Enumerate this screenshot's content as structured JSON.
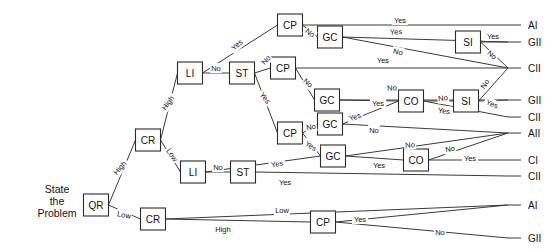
{
  "diagram": {
    "root_text_lines": [
      "State",
      "the",
      "Problem"
    ],
    "root_text_x": 57,
    "root_text_y": 205,
    "stroke_color": "#3a3a3a",
    "node_stroke": "#2a2a2a",
    "node_fill": "#ffffff",
    "text_color": "#111111"
  },
  "nodes": [
    {
      "id": "QR",
      "label": "QR",
      "x": 96,
      "y": 205,
      "w": 25,
      "h": 22
    },
    {
      "id": "CR1",
      "label": "CR",
      "x": 148,
      "y": 140,
      "w": 25,
      "h": 22
    },
    {
      "id": "CR2",
      "label": "CR",
      "x": 153,
      "y": 219,
      "w": 25,
      "h": 22
    },
    {
      "id": "LI1",
      "label": "LI",
      "x": 190,
      "y": 73,
      "w": 25,
      "h": 22
    },
    {
      "id": "LI2",
      "label": "LI",
      "x": 193,
      "y": 172,
      "w": 25,
      "h": 22
    },
    {
      "id": "ST1",
      "label": "ST",
      "x": 242,
      "y": 73,
      "w": 25,
      "h": 22
    },
    {
      "id": "ST2",
      "label": "ST",
      "x": 243,
      "y": 172,
      "w": 25,
      "h": 22
    },
    {
      "id": "CP1",
      "label": "CP",
      "x": 290,
      "y": 25,
      "w": 25,
      "h": 22
    },
    {
      "id": "CP2",
      "label": "CP",
      "x": 283,
      "y": 68,
      "w": 25,
      "h": 22
    },
    {
      "id": "CP3",
      "label": "CP",
      "x": 290,
      "y": 133,
      "w": 25,
      "h": 22
    },
    {
      "id": "CP4",
      "label": "CP",
      "x": 323,
      "y": 222,
      "w": 25,
      "h": 22
    },
    {
      "id": "GC1",
      "label": "GC",
      "x": 330,
      "y": 37,
      "w": 25,
      "h": 22
    },
    {
      "id": "GC2",
      "label": "GC",
      "x": 327,
      "y": 100,
      "w": 25,
      "h": 22
    },
    {
      "id": "GC3",
      "label": "GC",
      "x": 330,
      "y": 124,
      "w": 25,
      "h": 22
    },
    {
      "id": "GC4",
      "label": "GC",
      "x": 333,
      "y": 156,
      "w": 25,
      "h": 22
    },
    {
      "id": "CO1",
      "label": "CO",
      "x": 411,
      "y": 101,
      "w": 25,
      "h": 22
    },
    {
      "id": "CO2",
      "label": "CO",
      "x": 416,
      "y": 160,
      "w": 25,
      "h": 22
    },
    {
      "id": "SI1",
      "label": "SI",
      "x": 468,
      "y": 42,
      "w": 25,
      "h": 22
    },
    {
      "id": "SI2",
      "label": "SI",
      "x": 466,
      "y": 101,
      "w": 25,
      "h": 22
    }
  ],
  "outcomes": [
    {
      "id": "O1",
      "label": "AI",
      "x": 528,
      "y": 25,
      "tick_x": 508
    },
    {
      "id": "O2",
      "label": "GII",
      "x": 528,
      "y": 42,
      "tick_x": 508
    },
    {
      "id": "O3",
      "label": "CII",
      "x": 528,
      "y": 68,
      "tick_x": 508
    },
    {
      "id": "O4",
      "label": "GII",
      "x": 528,
      "y": 100,
      "tick_x": 508
    },
    {
      "id": "O5",
      "label": "CII",
      "x": 528,
      "y": 117,
      "tick_x": 508
    },
    {
      "id": "O6",
      "label": "AII",
      "x": 528,
      "y": 133,
      "tick_x": 508
    },
    {
      "id": "O7",
      "label": "CI",
      "x": 528,
      "y": 160,
      "tick_x": 508
    },
    {
      "id": "O8",
      "label": "CII",
      "x": 528,
      "y": 176,
      "tick_x": 508
    },
    {
      "id": "O9",
      "label": "AI",
      "x": 528,
      "y": 205,
      "tick_x": 508
    },
    {
      "id": "O10",
      "label": "GII",
      "x": 528,
      "y": 238,
      "tick_x": 508
    }
  ],
  "edges": [
    {
      "from": "QR",
      "to": "CR1",
      "label": "High",
      "lx": 120,
      "ly": 168,
      "rot": -50
    },
    {
      "from": "QR",
      "to": "CR2",
      "label": "Low",
      "lx": 124,
      "ly": 215,
      "rot": 12
    },
    {
      "from": "CR1",
      "to": "LI1",
      "label": "High",
      "lx": 168,
      "ly": 103,
      "rot": -54
    },
    {
      "from": "CR1",
      "to": "LI2",
      "label": "Low",
      "lx": 172,
      "ly": 155,
      "rot": 55
    },
    {
      "from": "LI1",
      "to": "CP1",
      "label": "Yes",
      "lx": 237,
      "ly": 45,
      "rot": -42
    },
    {
      "from": "LI1",
      "to": "ST1",
      "label": "No",
      "lx": 216,
      "ly": 68,
      "rot": 0
    },
    {
      "from": "ST1",
      "to": "CP2",
      "label": "No",
      "lx": 266,
      "ly": 60,
      "rot": -48
    },
    {
      "from": "ST1",
      "to": "CP3",
      "label": "Yes",
      "lx": 265,
      "ly": 98,
      "rot": 52
    },
    {
      "from": "CP1",
      "to": "O1",
      "label": "Yes",
      "lx": 400,
      "ly": 20,
      "rot": 0
    },
    {
      "from": "CP1",
      "to": "GC1",
      "label": "No",
      "lx": 310,
      "ly": 33,
      "rot": 38
    },
    {
      "from": "GC1",
      "to": "O2",
      "label": "Yes",
      "lx": 396,
      "ly": 32,
      "rot": -3
    },
    {
      "from": "GC1",
      "to": "O3",
      "label": "No",
      "lx": 398,
      "ly": 52,
      "rot": 11
    },
    {
      "from": "CP2",
      "to": "O3",
      "label": "Yes",
      "lx": 383,
      "ly": 60,
      "rot": 0
    },
    {
      "from": "CP2",
      "to": "GC2",
      "label": "No",
      "lx": 308,
      "ly": 83,
      "rot": 40
    },
    {
      "from": "GC2",
      "to": "O4",
      "label": "No",
      "lx": 392,
      "ly": 88,
      "rot": -3
    },
    {
      "from": "GC2",
      "to": "CO1",
      "label": "Yes",
      "lx": 378,
      "ly": 103,
      "rot": 0
    },
    {
      "from": "CO1",
      "to": "SI2",
      "label": "No",
      "lx": 443,
      "ly": 98,
      "rot": -8
    },
    {
      "from": "CO1",
      "to": "O5",
      "label": "Yes",
      "lx": 444,
      "ly": 111,
      "rot": 6
    },
    {
      "from": "SI2",
      "to": "O3",
      "label": "No",
      "lx": 485,
      "ly": 84,
      "rot": -58
    },
    {
      "from": "SI2",
      "to": "O4",
      "label": "Yes",
      "lx": 492,
      "ly": 104,
      "rot": 22
    },
    {
      "from": "SI1",
      "to": "O2",
      "label": "Yes",
      "lx": 493,
      "ly": 36,
      "rot": 0
    },
    {
      "from": "SI1",
      "to": "O3",
      "label": "No",
      "lx": 492,
      "ly": 55,
      "rot": 40
    },
    {
      "from": "CP3",
      "to": "GC3",
      "label": "No",
      "lx": 311,
      "ly": 127,
      "rot": -9
    },
    {
      "from": "CP3",
      "to": "GC4",
      "label": "Yes",
      "lx": 311,
      "ly": 146,
      "rot": 33
    },
    {
      "from": "GC3",
      "to": "CO1",
      "label": "Yes",
      "lx": 355,
      "ly": 117,
      "rot": -19
    },
    {
      "from": "GC3",
      "to": "O6",
      "label": "No",
      "lx": 374,
      "ly": 130,
      "rot": 0
    },
    {
      "from": "GC4",
      "to": "O6",
      "label": "No",
      "lx": 410,
      "ly": 145,
      "rot": -6
    },
    {
      "from": "GC4",
      "to": "CO2",
      "label": "Yes",
      "lx": 379,
      "ly": 165,
      "rot": 0
    },
    {
      "from": "CO2",
      "to": "O6",
      "label": "No",
      "lx": 450,
      "ly": 149,
      "rot": -9
    },
    {
      "from": "CO2",
      "to": "O7",
      "label": "Yes",
      "lx": 470,
      "ly": 158,
      "rot": 0
    },
    {
      "from": "LI2",
      "to": "GC4",
      "label": "Yes",
      "lx": 277,
      "ly": 164,
      "rot": -10
    },
    {
      "from": "LI2",
      "to": "ST2",
      "label": "No",
      "lx": 218,
      "ly": 167,
      "rot": 0
    },
    {
      "from": "ST2",
      "to": "O8",
      "label": "Yes",
      "lx": 285,
      "ly": 182,
      "rot": 0
    },
    {
      "from": "CR2",
      "to": "O9",
      "label": "Low",
      "lx": 282,
      "ly": 210,
      "rot": 0
    },
    {
      "from": "CR2",
      "to": "CP4",
      "label": "High",
      "lx": 223,
      "ly": 229,
      "rot": 0
    },
    {
      "from": "CP4",
      "to": "O9",
      "label": "Yes",
      "lx": 360,
      "ly": 219,
      "rot": 0
    },
    {
      "from": "CP4",
      "to": "O10",
      "label": "No",
      "lx": 440,
      "ly": 232,
      "rot": 0
    }
  ]
}
